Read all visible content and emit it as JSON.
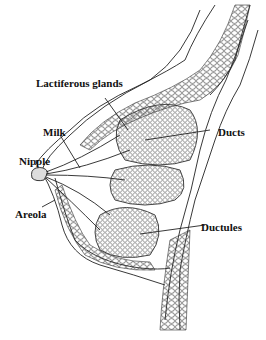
{
  "labels": {
    "lactiferous_glands": "Lactiferous glands",
    "milk": "Milk",
    "ducts": "Ducts",
    "nipple": "Nipple",
    "areola": "Areola",
    "ductules": "Ductules"
  },
  "colors": {
    "line": "#222222",
    "background": "#ffffff"
  }
}
